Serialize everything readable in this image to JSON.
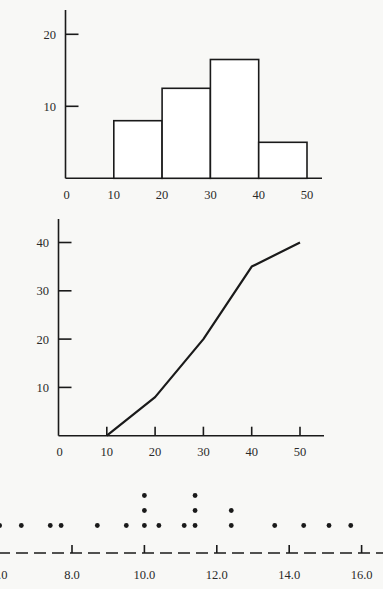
{
  "chart_data": [
    {
      "id": "histogram",
      "type": "bar",
      "title": "",
      "xlabel": "",
      "ylabel": "",
      "bins": [
        [
          10,
          20
        ],
        [
          20,
          30
        ],
        [
          30,
          40
        ],
        [
          40,
          50
        ]
      ],
      "categories": [
        "10-20",
        "20-30",
        "30-40",
        "40-50"
      ],
      "values": [
        8,
        12.5,
        16.5,
        5
      ],
      "xticks": [
        0,
        10,
        20,
        30,
        40,
        50
      ],
      "yticks": [
        10,
        20
      ],
      "xlim": [
        0,
        53
      ],
      "ylim": [
        0,
        23
      ],
      "grid": false,
      "legend": null
    },
    {
      "id": "cumulative-frequency",
      "type": "line",
      "title": "",
      "xlabel": "",
      "ylabel": "",
      "x": [
        10,
        20,
        30,
        40,
        50
      ],
      "values": [
        0,
        8,
        20,
        35,
        40
      ],
      "xticks": [
        0,
        10,
        20,
        30,
        40,
        50
      ],
      "yticks": [
        10,
        20,
        30,
        40
      ],
      "xlim": [
        0,
        54
      ],
      "ylim": [
        0,
        45
      ],
      "grid": false,
      "legend": null
    },
    {
      "id": "dot-plot",
      "type": "scatter",
      "title": "",
      "xlabel": "",
      "ylabel": "",
      "points": [
        {
          "x": 6.0,
          "count": 1
        },
        {
          "x": 6.6,
          "count": 1
        },
        {
          "x": 7.4,
          "count": 1
        },
        {
          "x": 7.7,
          "count": 1
        },
        {
          "x": 8.7,
          "count": 1
        },
        {
          "x": 9.5,
          "count": 1
        },
        {
          "x": 10.0,
          "count": 3
        },
        {
          "x": 10.4,
          "count": 1
        },
        {
          "x": 11.1,
          "count": 1
        },
        {
          "x": 11.4,
          "count": 3
        },
        {
          "x": 12.4,
          "count": 2
        },
        {
          "x": 13.6,
          "count": 1
        },
        {
          "x": 14.4,
          "count": 1
        },
        {
          "x": 15.1,
          "count": 1
        },
        {
          "x": 15.7,
          "count": 1
        }
      ],
      "xticks": [
        "6.0",
        "8.0",
        "10.0",
        "12.0",
        "14.0",
        "16.0"
      ],
      "xlim": [
        6.0,
        16.6
      ],
      "grid": false,
      "legend": null
    }
  ]
}
